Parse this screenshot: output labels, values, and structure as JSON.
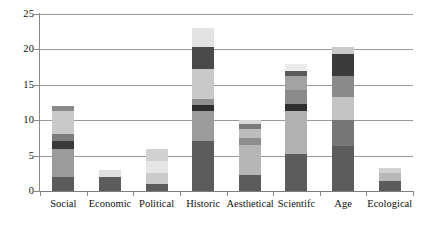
{
  "chart_data": {
    "type": "bar",
    "subtype": "stacked-bar",
    "title": "",
    "xlabel": "",
    "ylabel": "",
    "ylim": [
      0,
      25
    ],
    "yticks": [
      0,
      5,
      10,
      15,
      20,
      25
    ],
    "ytick_labels": [
      "0",
      "5",
      "10",
      "15",
      "20",
      "25"
    ],
    "grid": "horizontal",
    "legend": "none",
    "categories": [
      "Social",
      "Economic",
      "Political",
      "Historic",
      "Aesthetical",
      "Scientifc",
      "Age",
      "Ecological"
    ],
    "totals": [
      12,
      3,
      6,
      23,
      10,
      18,
      20.3,
      3.3
    ],
    "segment_colors": [
      "#5c5c5c",
      "#9b9b9b",
      "#3a3a3a",
      "#7d7d7d",
      "#c9c9c9",
      "#2e2e2e",
      "#e8e8e8",
      "#b0b0b0",
      "#6e6e6e",
      "#dcdcdc"
    ],
    "bars": [
      {
        "category": "Social",
        "total": 12,
        "segments": [
          {
            "value": 2.0,
            "color": "#5c5c5c"
          },
          {
            "value": 4.0,
            "color": "#9b9b9b"
          },
          {
            "value": 1.0,
            "color": "#3a3a3a"
          },
          {
            "value": 1.0,
            "color": "#7d7d7d"
          },
          {
            "value": 3.3,
            "color": "#c9c9c9"
          },
          {
            "value": 0.7,
            "color": "#8a8a8a"
          }
        ]
      },
      {
        "category": "Economic",
        "total": 3,
        "segments": [
          {
            "value": 2.0,
            "color": "#5c5c5c"
          },
          {
            "value": 1.0,
            "color": "#e0e0e0"
          }
        ]
      },
      {
        "category": "Political",
        "total": 6,
        "segments": [
          {
            "value": 1.0,
            "color": "#5c5c5c"
          },
          {
            "value": 1.5,
            "color": "#cacaca"
          },
          {
            "value": 1.8,
            "color": "#e6e6e6"
          },
          {
            "value": 1.7,
            "color": "#d2d2d2"
          }
        ]
      },
      {
        "category": "Historic",
        "total": 23,
        "segments": [
          {
            "value": 7.0,
            "color": "#5c5c5c"
          },
          {
            "value": 4.3,
            "color": "#9b9b9b"
          },
          {
            "value": 0.9,
            "color": "#2e2e2e"
          },
          {
            "value": 0.8,
            "color": "#8f8f8f"
          },
          {
            "value": 4.2,
            "color": "#c9c9c9"
          },
          {
            "value": 3.1,
            "color": "#4a4a4a"
          },
          {
            "value": 2.7,
            "color": "#e3e3e3"
          }
        ]
      },
      {
        "category": "Aesthetical",
        "total": 10,
        "segments": [
          {
            "value": 2.2,
            "color": "#5c5c5c"
          },
          {
            "value": 4.3,
            "color": "#b6b6b6"
          },
          {
            "value": 1.0,
            "color": "#8e8e8e"
          },
          {
            "value": 1.3,
            "color": "#bdbdbd"
          },
          {
            "value": 0.6,
            "color": "#7a7a7a"
          },
          {
            "value": 0.6,
            "color": "#d9d9d9"
          }
        ]
      },
      {
        "category": "Scientifc",
        "total": 18,
        "segments": [
          {
            "value": 5.2,
            "color": "#5c5c5c"
          },
          {
            "value": 6.1,
            "color": "#b2b2b2"
          },
          {
            "value": 1.0,
            "color": "#2e2e2e"
          },
          {
            "value": 2.0,
            "color": "#8b8b8b"
          },
          {
            "value": 1.9,
            "color": "#a3a3a3"
          },
          {
            "value": 0.8,
            "color": "#5a5a5a"
          },
          {
            "value": 1.0,
            "color": "#ececec"
          }
        ]
      },
      {
        "category": "Age",
        "total": 20.3,
        "segments": [
          {
            "value": 6.3,
            "color": "#5c5c5c"
          },
          {
            "value": 3.7,
            "color": "#777777"
          },
          {
            "value": 3.3,
            "color": "#c4c4c4"
          },
          {
            "value": 2.9,
            "color": "#8a8a8a"
          },
          {
            "value": 3.1,
            "color": "#3a3a3a"
          },
          {
            "value": 1.0,
            "color": "#c9c9c9"
          }
        ]
      },
      {
        "category": "Ecological",
        "total": 3.3,
        "segments": [
          {
            "value": 1.4,
            "color": "#5c5c5c"
          },
          {
            "value": 1.1,
            "color": "#b8b8b8"
          },
          {
            "value": 0.8,
            "color": "#d2d2d2"
          }
        ]
      }
    ]
  },
  "axis": {
    "grid_color": "#9a9a9a",
    "axis_color": "#8a8a8a",
    "text_color": "#111111"
  }
}
